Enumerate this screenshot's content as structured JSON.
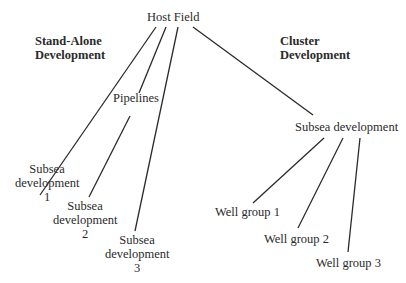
{
  "diagram": {
    "root": "Host Field",
    "headers": {
      "standalone": [
        "Stand-Alone",
        "Development"
      ],
      "cluster": [
        "Cluster",
        "Development"
      ]
    },
    "pipelines_label": "Pipelines",
    "standalone_nodes": [
      {
        "lines": [
          "Subsea",
          "development",
          "1"
        ]
      },
      {
        "lines": [
          "Subsea",
          "development",
          "2"
        ]
      },
      {
        "lines": [
          "Subsea",
          "development",
          "3"
        ]
      }
    ],
    "cluster_hub": "Subsea development",
    "cluster_nodes": [
      "Well group 1",
      "Well group 2",
      "Well group 3"
    ],
    "line_color": "#2a2a2a"
  }
}
